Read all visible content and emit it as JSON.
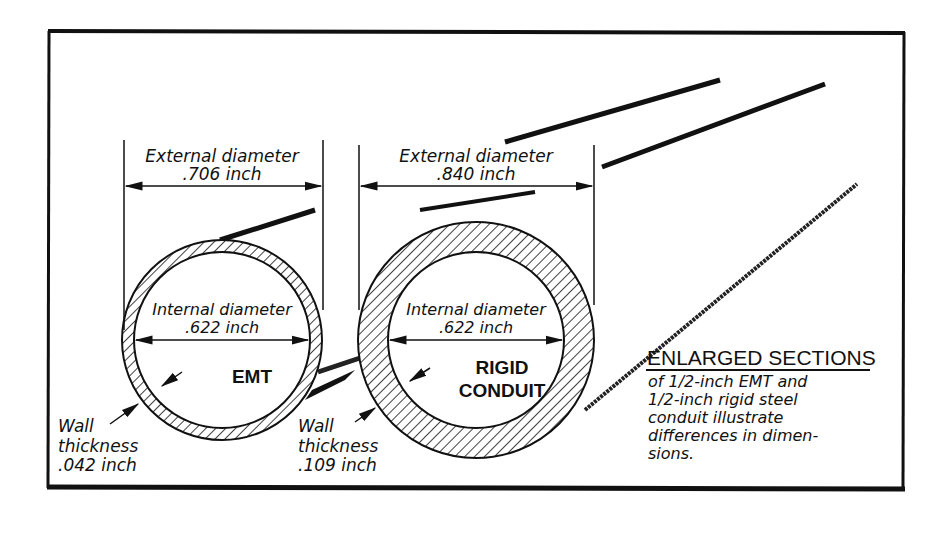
{
  "figure": {
    "title": "ENLARGED SECTIONS",
    "caption_lines": [
      "of 1/2-inch EMT and",
      "1/2-inch rigid steel",
      "conduit illustrate",
      "differences in dimen-",
      "sions."
    ],
    "emt": {
      "name": "EMT",
      "external_label": "External diameter",
      "external_value": ".706 inch",
      "internal_label": "Internal diameter",
      "internal_value": ".622 inch",
      "wall_label_1": "Wall",
      "wall_label_2": "thickness",
      "wall_value": ".042 inch"
    },
    "rigid": {
      "name_line1": "RIGID",
      "name_line2": "CONDUIT",
      "external_label": "External diameter",
      "external_value": ".840 inch",
      "internal_label": "Internal diameter",
      "internal_value": ".622 inch",
      "wall_label_1": "Wall",
      "wall_label_2": "thickness",
      "wall_value": ".109 inch"
    }
  }
}
